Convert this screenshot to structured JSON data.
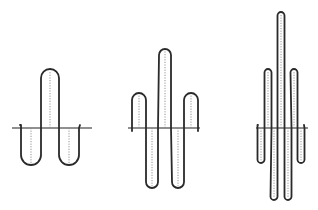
{
  "figure": {
    "panels": [
      {
        "id": "panel-1",
        "axis": {
          "x1": 12,
          "x2": 92,
          "y": 128
        },
        "start": [
          20,
          125
        ],
        "end": [
          80,
          125
        ],
        "lobes": [
          {
            "x": 31,
            "extreme": 165,
            "half_width": 10
          },
          {
            "x": 50,
            "extreme": 69,
            "half_width": 9
          },
          {
            "x": 69,
            "extreme": 165,
            "half_width": 10
          }
        ]
      },
      {
        "id": "panel-2",
        "axis": {
          "x1": 128,
          "x2": 200,
          "y": 128
        },
        "start": [
          132,
          131
        ],
        "end": [
          198,
          131
        ],
        "lobes": [
          {
            "x": 139,
            "extreme": 93,
            "half_width": 7
          },
          {
            "x": 152,
            "extreme": 188,
            "half_width": 6
          },
          {
            "x": 165,
            "extreme": 49,
            "half_width": 6
          },
          {
            "x": 178,
            "extreme": 188,
            "half_width": 6
          },
          {
            "x": 191,
            "extreme": 93,
            "half_width": 7
          }
        ]
      },
      {
        "id": "panel-3",
        "axis": {
          "x1": 256,
          "x2": 308,
          "y": 128
        },
        "start": [
          258,
          125
        ],
        "end": [
          304,
          125
        ],
        "lobes": [
          {
            "x": 261,
            "extreme": 163,
            "half_width": 3.5
          },
          {
            "x": 268,
            "extreme": 69,
            "half_width": 3.5
          },
          {
            "x": 274,
            "extreme": 200,
            "half_width": 3.5
          },
          {
            "x": 281,
            "extreme": 12,
            "half_width": 3.5
          },
          {
            "x": 288,
            "extreme": 200,
            "half_width": 3.5
          },
          {
            "x": 294,
            "extreme": 69,
            "half_width": 3.5
          },
          {
            "x": 301,
            "extreme": 163,
            "half_width": 3.5
          }
        ]
      }
    ],
    "colors": {
      "line": "#2a2a2a",
      "dotted": "#888888",
      "background": "#ffffff"
    }
  }
}
